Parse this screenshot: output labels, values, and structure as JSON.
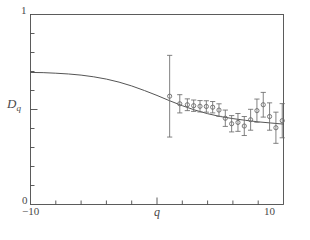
{
  "figure": {
    "background": "#ffffff",
    "ink_color": "#4a4a4a",
    "curve_color": "#555555",
    "marker_color": "#6b6b6b"
  },
  "axes": {
    "y_top_label": "1",
    "y_bottom_label": "0",
    "x_left_label": "−10",
    "x_right_label": "10",
    "y_axis_name": "D",
    "y_axis_name_sub": "q",
    "x_axis_name": "q"
  },
  "chart_data": {
    "type": "scatter",
    "title": "",
    "xlabel": "q",
    "ylabel": "D_q",
    "xlim": [
      -10,
      10
    ],
    "ylim": [
      0,
      1
    ],
    "grid": false,
    "legend": "none",
    "x_ticks": [
      -10,
      -8,
      -6,
      -4,
      -2,
      0,
      2,
      4,
      6,
      8,
      10
    ],
    "x_tick_labels": [
      "-10",
      "",
      "",
      "",
      "",
      "",
      "",
      "",
      "",
      "",
      "10"
    ],
    "y_ticks": [
      0,
      0.1,
      0.2,
      0.3,
      0.4,
      0.5,
      0.6,
      0.7,
      0.8,
      0.9,
      1
    ],
    "y_tick_labels": [
      "0",
      "",
      "",
      "",
      "",
      "",
      "",
      "",
      "",
      "",
      "1"
    ],
    "series": [
      {
        "name": "model curve",
        "type": "line",
        "x": [
          -10.0,
          -9.0,
          -8.0,
          -7.0,
          -6.0,
          -5.0,
          -4.0,
          -3.0,
          -2.0,
          -1.0,
          0.0,
          1.0,
          2.0,
          3.0,
          4.0,
          5.0,
          6.0,
          7.0,
          8.0,
          9.0,
          10.0
        ],
        "y": [
          0.695,
          0.694,
          0.691,
          0.687,
          0.681,
          0.672,
          0.66,
          0.644,
          0.624,
          0.6,
          0.574,
          0.546,
          0.52,
          0.497,
          0.478,
          0.463,
          0.452,
          0.443,
          0.435,
          0.429,
          0.423
        ]
      },
      {
        "name": "measurements",
        "type": "scatter_errorbar",
        "marker": "circle-open",
        "x": [
          1.0,
          1.8,
          2.4,
          2.9,
          3.4,
          3.9,
          4.4,
          4.9,
          5.4,
          5.9,
          6.4,
          6.9,
          7.4,
          7.9,
          8.4,
          8.9,
          9.4,
          9.9
        ],
        "y": [
          0.57,
          0.53,
          0.525,
          0.52,
          0.517,
          0.516,
          0.512,
          0.497,
          0.454,
          0.425,
          0.432,
          0.413,
          0.446,
          0.494,
          0.525,
          0.463,
          0.404,
          0.441
        ],
        "yerr": [
          0.215,
          0.048,
          0.031,
          0.03,
          0.03,
          0.03,
          0.03,
          0.033,
          0.043,
          0.043,
          0.047,
          0.05,
          0.055,
          0.061,
          0.065,
          0.072,
          0.082,
          0.09
        ]
      }
    ]
  }
}
